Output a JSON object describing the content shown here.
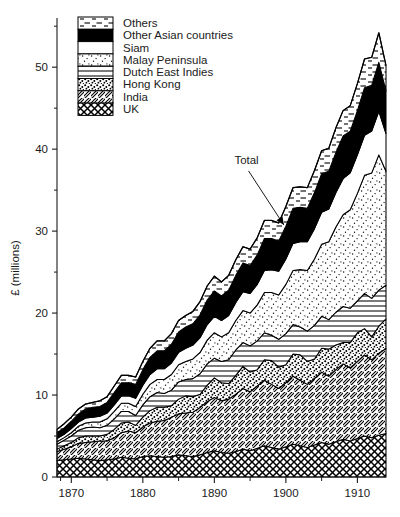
{
  "chart_data": {
    "type": "area",
    "stacked": true,
    "title": "",
    "subtitle": "",
    "xlabel": "",
    "ylabel": "£ (millions)",
    "xlim": [
      1868,
      1914
    ],
    "ylim": [
      0,
      56
    ],
    "x_ticks": [
      1870,
      1880,
      1890,
      1900,
      1910
    ],
    "x_tick_labels": [
      "1870",
      "1880",
      "1890",
      "1900",
      "1910"
    ],
    "x_minor_tick_step": 5,
    "y_ticks": [
      0,
      10,
      20,
      30,
      40,
      50
    ],
    "y_tick_labels": [
      "0",
      "10",
      "20",
      "30",
      "40",
      "50"
    ],
    "y_minor_ticks": [
      5,
      15,
      25,
      35,
      45,
      55
    ],
    "grid": false,
    "legend_position": "top-left",
    "annotations": [
      {
        "text": "Total",
        "points_to_year": 1900,
        "points_to_value": 30.5,
        "label_x": 1894.5,
        "label_y": 38.2
      }
    ],
    "stack_order_bottom_to_top": [
      "UK",
      "India",
      "Hong Kong",
      "Dutch East Indies",
      "Malay Peninsula",
      "Siam",
      "Other Asian countries",
      "Others"
    ],
    "x": [
      1868,
      1869,
      1870,
      1871,
      1872,
      1873,
      1874,
      1875,
      1876,
      1877,
      1878,
      1879,
      1880,
      1881,
      1882,
      1883,
      1884,
      1885,
      1886,
      1887,
      1888,
      1889,
      1890,
      1891,
      1892,
      1893,
      1894,
      1895,
      1896,
      1897,
      1898,
      1899,
      1900,
      1901,
      1902,
      1903,
      1904,
      1905,
      1906,
      1907,
      1908,
      1909,
      1910,
      1911,
      1912,
      1913,
      1914
    ],
    "series": [
      {
        "name": "UK",
        "pattern": "crosshatch",
        "values": [
          2.0,
          2.1,
          2.2,
          2.3,
          2.2,
          2.1,
          2.0,
          2.1,
          2.2,
          2.4,
          2.3,
          2.2,
          2.5,
          2.6,
          2.5,
          2.4,
          2.5,
          2.7,
          2.6,
          2.5,
          2.7,
          3.0,
          3.2,
          3.0,
          2.9,
          3.1,
          3.4,
          3.2,
          3.5,
          3.8,
          3.6,
          3.4,
          3.7,
          4.0,
          3.8,
          3.6,
          3.9,
          4.2,
          4.0,
          4.3,
          4.6,
          4.4,
          4.7,
          5.0,
          4.8,
          5.1,
          5.3
        ]
      },
      {
        "name": "India",
        "pattern": "diagonal-hatch",
        "values": [
          1.1,
          1.3,
          1.5,
          1.8,
          2.0,
          2.2,
          2.4,
          2.3,
          2.6,
          3.0,
          3.3,
          3.2,
          3.6,
          4.0,
          4.3,
          4.5,
          4.8,
          5.0,
          5.2,
          5.4,
          5.8,
          6.2,
          6.5,
          6.3,
          6.6,
          7.0,
          7.4,
          7.2,
          7.6,
          8.0,
          7.7,
          7.4,
          7.8,
          8.3,
          8.0,
          7.7,
          8.1,
          8.6,
          8.3,
          8.8,
          9.2,
          8.9,
          9.4,
          9.9,
          9.5,
          10.0,
          10.4
        ]
      },
      {
        "name": "Hong Kong",
        "pattern": "dense-dots",
        "values": [
          0.3,
          0.4,
          0.5,
          0.7,
          0.8,
          0.7,
          0.6,
          0.8,
          1.0,
          1.2,
          1.1,
          0.9,
          1.2,
          1.5,
          1.7,
          1.6,
          1.4,
          1.8,
          2.1,
          1.9,
          1.6,
          2.0,
          2.4,
          2.2,
          1.9,
          2.3,
          2.7,
          2.4,
          2.0,
          2.5,
          2.9,
          2.6,
          2.2,
          2.7,
          3.1,
          2.8,
          2.4,
          2.9,
          3.3,
          3.0,
          2.6,
          3.1,
          3.5,
          3.2,
          2.8,
          3.3,
          3.6
        ]
      },
      {
        "name": "Dutch East Indies",
        "pattern": "horizontal-lines",
        "values": [
          0.6,
          0.7,
          0.8,
          0.9,
          1.0,
          1.1,
          1.0,
          1.1,
          1.3,
          1.4,
          1.3,
          1.2,
          1.5,
          1.7,
          1.8,
          1.7,
          1.9,
          2.1,
          2.0,
          2.2,
          2.5,
          2.6,
          2.4,
          2.6,
          2.9,
          3.1,
          2.9,
          3.2,
          3.5,
          3.3,
          3.1,
          3.4,
          3.8,
          3.6,
          3.4,
          3.7,
          4.1,
          3.9,
          3.6,
          4.0,
          4.4,
          4.2,
          3.9,
          4.3,
          4.7,
          4.4,
          4.1
        ]
      },
      {
        "name": "Malay Peninsula",
        "pattern": "stipple-dots",
        "values": [
          0.3,
          0.3,
          0.4,
          0.5,
          0.6,
          0.6,
          0.7,
          0.8,
          0.9,
          1.0,
          1.0,
          1.1,
          1.3,
          1.5,
          1.6,
          1.7,
          1.9,
          2.1,
          2.2,
          2.4,
          2.6,
          2.9,
          3.1,
          3.0,
          3.3,
          3.6,
          3.9,
          4.0,
          4.4,
          4.9,
          5.2,
          5.4,
          6.0,
          6.6,
          7.0,
          7.4,
          8.1,
          8.8,
          9.5,
          10.4,
          11.2,
          12.0,
          13.1,
          14.4,
          15.3,
          16.5,
          13.9
        ]
      },
      {
        "name": "Siam",
        "pattern": "white",
        "values": [
          0.4,
          0.4,
          0.5,
          0.5,
          0.6,
          0.6,
          0.7,
          0.7,
          0.8,
          0.9,
          0.9,
          1.0,
          1.1,
          1.2,
          1.3,
          1.3,
          1.4,
          1.5,
          1.6,
          1.7,
          1.8,
          1.9,
          2.0,
          2.0,
          2.1,
          2.2,
          2.3,
          2.4,
          2.5,
          2.7,
          2.8,
          2.9,
          3.1,
          3.3,
          3.4,
          3.5,
          3.7,
          3.9,
          4.0,
          4.2,
          4.4,
          4.5,
          4.7,
          4.9,
          5.1,
          5.3,
          4.6
        ]
      },
      {
        "name": "Other Asian countries",
        "pattern": "solid-black",
        "values": [
          0.7,
          0.8,
          0.9,
          1.0,
          1.1,
          1.2,
          1.2,
          1.3,
          1.5,
          1.6,
          1.6,
          1.7,
          1.9,
          2.1,
          2.2,
          2.2,
          2.3,
          2.5,
          2.6,
          2.6,
          2.8,
          3.0,
          3.1,
          3.0,
          3.1,
          3.3,
          3.5,
          3.4,
          3.6,
          3.9,
          3.8,
          3.7,
          4.0,
          4.3,
          4.2,
          4.1,
          4.4,
          4.7,
          4.6,
          4.9,
          5.2,
          5.1,
          5.4,
          5.8,
          5.6,
          6.0,
          5.2
        ]
      },
      {
        "name": "Others",
        "pattern": "dashed-lines",
        "values": [
          0.4,
          0.5,
          0.5,
          0.6,
          0.6,
          0.6,
          0.7,
          0.7,
          0.8,
          0.9,
          0.9,
          0.9,
          1.0,
          1.1,
          1.2,
          1.2,
          1.3,
          1.4,
          1.4,
          1.5,
          1.6,
          1.7,
          1.8,
          1.7,
          1.8,
          1.9,
          2.0,
          2.0,
          2.1,
          2.2,
          2.2,
          2.2,
          2.4,
          2.5,
          2.5,
          2.5,
          2.7,
          2.8,
          2.8,
          3.0,
          3.1,
          3.1,
          3.3,
          3.5,
          3.4,
          3.6,
          3.1
        ]
      }
    ]
  },
  "legend": {
    "items": [
      {
        "label": "Others",
        "pattern": "dashed-lines"
      },
      {
        "label": "Other Asian countries",
        "pattern": "solid-black"
      },
      {
        "label": "Siam",
        "pattern": "white"
      },
      {
        "label": "Malay Peninsula",
        "pattern": "stipple-dots"
      },
      {
        "label": "Dutch East Indies",
        "pattern": "horizontal-lines"
      },
      {
        "label": "Hong Kong",
        "pattern": "dense-dots"
      },
      {
        "label": "India",
        "pattern": "diagonal-hatch"
      },
      {
        "label": "UK",
        "pattern": "crosshatch"
      }
    ]
  },
  "colors": {
    "ink": "#1a1a1a",
    "background": "#ffffff",
    "fill_black": "#000000",
    "fill_white": "#ffffff"
  }
}
